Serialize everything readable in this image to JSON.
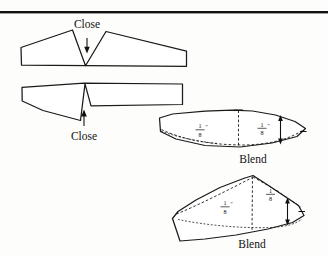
{
  "figure": {
    "background_color": "#fdfdfb",
    "ink_color": "#1a1a1a",
    "rule_color": "#111111"
  },
  "labels": {
    "close_top": "Close",
    "close_bottom": "Close",
    "blend_middle": "Blend",
    "blend_bottom": "Blend"
  },
  "dimensions": {
    "eighth_numerator": "1",
    "eighth_denominator": "8",
    "inch_mark": "″",
    "middle_left": "1/8″",
    "middle_right": "1/8″",
    "bottom_left": "1/8″",
    "bottom_right": "1/8″"
  },
  "shapes": {
    "piece_top": {
      "name": "upper-pattern-piece-with-open-dart",
      "note": "wedge notch opening upward, arrow points down into notch"
    },
    "piece_second": {
      "name": "lower-pattern-piece-with-open-dart",
      "note": "narrow slit notch opening downward, arrow points up into notch"
    },
    "piece_blend_middle": {
      "name": "blended-leaf-pattern-piece",
      "note": "dart closed, seam line blended with dashed original outline"
    },
    "piece_blend_bottom": {
      "name": "blended-wing-pattern-piece",
      "note": "dart closed, apex peak, dashed original outline"
    }
  },
  "annotations": {
    "arrow_down_label": "close-dart-arrow-down",
    "arrow_up_label": "close-dart-arrow-up",
    "center_dashed_middle": "center-fold-dashed-line",
    "center_dashed_bottom": "center-fold-dashed-line",
    "measure_arrow_middle": "vertical-measure-arrow",
    "measure_arrow_bottom": "vertical-measure-arrow"
  }
}
